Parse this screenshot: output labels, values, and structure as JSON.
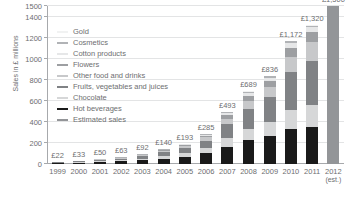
{
  "chart_data": {
    "type": "bar",
    "subtype": "stacked-bar",
    "title": "",
    "xlabel": "",
    "ylabel": "Sales in £ millions",
    "ylim": [
      0,
      1500
    ],
    "yticks": [
      0,
      200,
      400,
      600,
      800,
      1000,
      1200,
      1400,
      1500
    ],
    "ytick_labels": [
      "0",
      "200",
      "400",
      "600",
      "800",
      "1000",
      "1200",
      "1400",
      "1500"
    ],
    "grid": true,
    "legend_position": "inside-top-left",
    "categories": [
      "1999",
      "2000",
      "2001",
      "2002",
      "2003",
      "2004",
      "2005",
      "2006",
      "2007",
      "2008",
      "2009",
      "2010",
      "2011",
      "2012"
    ],
    "category_sublabels": [
      "",
      "",
      "",
      "",
      "",
      "",
      "",
      "",
      "",
      "",
      "",
      "",
      "",
      "(est.)"
    ],
    "totals": [
      22,
      33,
      50,
      63,
      92,
      140,
      193,
      285,
      493,
      689,
      836,
      1172,
      1320,
      1500
    ],
    "total_labels": [
      "£22",
      "£33",
      "£50",
      "£63",
      "£92",
      "£140",
      "£193",
      "£285",
      "£493",
      "£689",
      "£836",
      "£1,172",
      "£1,320",
      "£1,500"
    ],
    "series": [
      {
        "name": "Hot beverages",
        "color": "#1a1a1a",
        "values": [
          9,
          13,
          19,
          24,
          35,
          52,
          70,
          100,
          165,
          225,
          265,
          330,
          350,
          0
        ]
      },
      {
        "name": "Chocolate",
        "color": "#d6d7d8",
        "values": [
          4,
          6,
          9,
          11,
          16,
          24,
          33,
          48,
          83,
          112,
          135,
          180,
          210,
          0
        ]
      },
      {
        "name": "Fruits, vegetables and juices",
        "color": "#808285",
        "values": [
          5,
          8,
          12,
          15,
          22,
          34,
          48,
          72,
          130,
          185,
          235,
          360,
          420,
          0
        ]
      },
      {
        "name": "Other food and drinks",
        "color": "#c7c8ca",
        "values": [
          2,
          3,
          5,
          7,
          10,
          15,
          20,
          32,
          54,
          80,
          97,
          145,
          175,
          0
        ]
      },
      {
        "name": "Flowers",
        "color": "#9d9fa2",
        "values": [
          1,
          2,
          3,
          3,
          5,
          8,
          12,
          18,
          30,
          45,
          55,
          85,
          95,
          0
        ]
      },
      {
        "name": "Cotton products",
        "color": "#e6e7e8",
        "values": [
          0.5,
          0.7,
          1,
          1.5,
          2,
          4,
          6,
          9,
          18,
          26,
          29,
          45,
          50,
          0
        ]
      },
      {
        "name": "Cosmetics",
        "color": "#b1b3b6",
        "values": [
          0.3,
          0.2,
          0.6,
          1,
          1.5,
          2,
          3,
          5,
          10,
          13,
          16,
          22,
          15,
          0
        ]
      },
      {
        "name": "Gold",
        "color": "#f1f2f2",
        "values": [
          0.2,
          0.1,
          0.4,
          0.5,
          0.5,
          1,
          1,
          1,
          3,
          3,
          4,
          5,
          5,
          0
        ]
      },
      {
        "name": "Estimated sales",
        "color": "#939598",
        "values": [
          0,
          0,
          0,
          0,
          0,
          0,
          0,
          0,
          0,
          0,
          0,
          0,
          0,
          1500
        ]
      }
    ],
    "legend": [
      {
        "label": "Gold",
        "color": "#f1f2f2"
      },
      {
        "label": "Cosmetics",
        "color": "#b1b3b6"
      },
      {
        "label": "Cotton products",
        "color": "#e6e7e8"
      },
      {
        "label": "Flowers",
        "color": "#9d9fa2"
      },
      {
        "label": "Other food and drinks",
        "color": "#c7c8ca"
      },
      {
        "label": "Fruits, vegetables and juices",
        "color": "#808285"
      },
      {
        "label": "Chocolate",
        "color": "#d6d7d8"
      },
      {
        "label": "Hot beverages",
        "color": "#1a1a1a"
      },
      {
        "label": "Estimated sales",
        "color": "#939598"
      }
    ]
  }
}
